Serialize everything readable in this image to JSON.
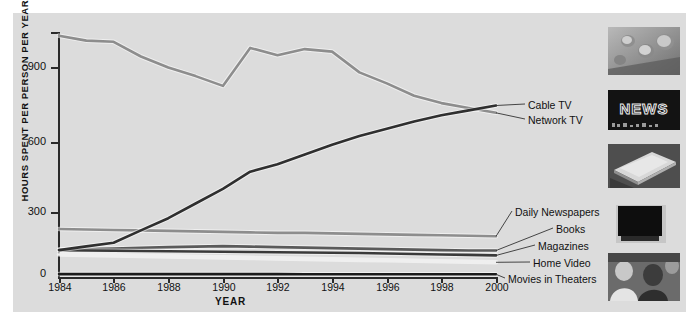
{
  "chart_data": {
    "type": "line",
    "title": "",
    "xlabel": "YEAR",
    "ylabel": "HOURS SPENT PER PERSON PER YEAR",
    "xlim": [
      1984,
      2000
    ],
    "ylim": [
      0,
      1000
    ],
    "yticks": [
      0,
      300,
      600,
      900
    ],
    "xticks": [
      1984,
      1986,
      1988,
      1990,
      1992,
      1994,
      1996,
      1998,
      2000
    ],
    "grid": false,
    "legend_position": "right-inline-labels",
    "x": [
      1984,
      1985,
      1986,
      1987,
      1988,
      1989,
      1990,
      1991,
      1992,
      1993,
      1994,
      1995,
      1996,
      1997,
      1998,
      1999,
      2000
    ],
    "series": [
      {
        "name": "Network TV",
        "color": "#8d8d8d",
        "values": [
          985,
          965,
          960,
          900,
          855,
          820,
          780,
          935,
          905,
          930,
          920,
          835,
          790,
          740,
          710,
          690,
          670
        ]
      },
      {
        "name": "Cable TV",
        "color": "#2f2f2f",
        "values": [
          110,
          125,
          140,
          190,
          240,
          300,
          360,
          430,
          460,
          500,
          540,
          575,
          605,
          635,
          660,
          680,
          700
        ]
      },
      {
        "name": "Daily Newspapers",
        "color": "#8d8d8d",
        "values": [
          196,
          194,
          192,
          190,
          188,
          186,
          184,
          182,
          180,
          180,
          178,
          176,
          174,
          172,
          170,
          168,
          166
        ]
      },
      {
        "name": "Books",
        "color": "#5a5a5a",
        "values": [
          112,
          114,
          116,
          119,
          122,
          124,
          126,
          124,
          122,
          120,
          118,
          116,
          114,
          112,
          110,
          108,
          108
        ]
      },
      {
        "name": "Magazines",
        "color": "#3a3a3a",
        "values": [
          110,
          108,
          107,
          106,
          105,
          104,
          103,
          102,
          101,
          100,
          99,
          98,
          96,
          94,
          92,
          90,
          88
        ]
      },
      {
        "name": "Home Video",
        "color": "#efefef",
        "values": [
          92,
          90,
          88,
          86,
          84,
          82,
          80,
          78,
          76,
          74,
          72,
          70,
          68,
          66,
          64,
          62,
          60
        ]
      },
      {
        "name": "Movies in Theaters",
        "color": "#1b1b1b",
        "values": [
          12,
          12,
          12,
          12,
          12,
          12,
          12,
          12,
          12,
          11,
          11,
          11,
          11,
          11,
          11,
          11,
          11
        ]
      }
    ]
  },
  "legend": [
    {
      "label": "Cable TV"
    },
    {
      "label": "Network TV"
    },
    {
      "label": "Daily Newspapers"
    },
    {
      "label": "Books"
    },
    {
      "label": "Magazines"
    },
    {
      "label": "Home Video"
    },
    {
      "label": "Movies in Theaters"
    }
  ],
  "thumbnails": [
    {
      "name": "game-controller-photo",
      "caption": ""
    },
    {
      "name": "news-neon-sign-photo",
      "caption": "NEWS"
    },
    {
      "name": "magazine-stack-photo",
      "caption": ""
    },
    {
      "name": "television-screen-photo",
      "caption": ""
    },
    {
      "name": "movie-audience-photo",
      "caption": ""
    }
  ],
  "axis": {
    "ytick_labels": [
      "900",
      "600",
      "300",
      "0"
    ],
    "xtick_labels": [
      "1984",
      "1986",
      "1988",
      "1990",
      "1992",
      "1994",
      "1996",
      "1998",
      "2000"
    ],
    "xaxis_title": "YEAR",
    "yaxis_title": "HOURS SPENT PER PERSON PER YEAR"
  }
}
